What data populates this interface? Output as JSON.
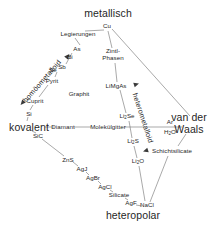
{
  "diagram": {
    "language": "de",
    "stroke_color": "#6e6e6e",
    "text_color": "#1f1f1f",
    "background": "#ffffff",
    "corners": [
      {
        "id": "metallisch",
        "label": "metallisch",
        "x": 108,
        "y": 13
      },
      {
        "id": "kovalent",
        "label": "kovalent",
        "x": 29,
        "y": 127
      },
      {
        "id": "van-der-waals",
        "label": "van der",
        "label2": "Waals",
        "x": 189,
        "y": 124
      },
      {
        "id": "heteropolar",
        "label": "heteropolar",
        "x": 133,
        "y": 215
      }
    ],
    "axis_labels": [
      {
        "id": "homoeometalloid",
        "label": "homöometalloid",
        "x": 42,
        "y": 81,
        "rotate": -49
      },
      {
        "id": "heterometalloid",
        "label": "heterometalloid",
        "x": 143,
        "y": 118,
        "rotate": 72
      }
    ],
    "compounds": [
      {
        "id": "cu",
        "label": "Cu",
        "x": 107,
        "y": 26
      },
      {
        "id": "legierungen",
        "label": "Legierungen",
        "x": 78,
        "y": 34
      },
      {
        "id": "as",
        "label": "As",
        "x": 77,
        "y": 49
      },
      {
        "id": "bi",
        "label": "Bi",
        "x": 70,
        "y": 57
      },
      {
        "id": "sb",
        "label": "Sb",
        "x": 62,
        "y": 67
      },
      {
        "id": "se",
        "label": "Se",
        "x": 53,
        "y": 70
      },
      {
        "id": "pyrit",
        "label": "Pyrit",
        "x": 52,
        "y": 81
      },
      {
        "id": "cuprit",
        "label": "Cuprit",
        "x": 35,
        "y": 101
      },
      {
        "id": "si",
        "label": "Si",
        "x": 29,
        "y": 114
      },
      {
        "id": "graphit",
        "label": "Graphit",
        "x": 79,
        "y": 94
      },
      {
        "id": "zintl-phasen",
        "label": "Zintl-",
        "label2": "Phasen",
        "x": 113,
        "y": 55
      },
      {
        "id": "limgas",
        "label": "LiMgAs",
        "x": 116,
        "y": 86
      },
      {
        "id": "li2se",
        "label": "Li₂Se",
        "x": 127,
        "y": 117
      },
      {
        "id": "li2s",
        "label": "Li₂S",
        "x": 133,
        "y": 142
      },
      {
        "id": "li2o",
        "label": "Li₂O",
        "x": 138,
        "y": 162
      },
      {
        "id": "diamant",
        "label": "Diamant",
        "x": 63,
        "y": 127
      },
      {
        "id": "molekuelgitter",
        "label": "Molekülgitter",
        "x": 108,
        "y": 127
      },
      {
        "id": "ar",
        "label": "Ar",
        "x": 170,
        "y": 122
      },
      {
        "id": "h2o",
        "label": "H₂O",
        "x": 170,
        "y": 133
      },
      {
        "id": "schichtsilicate",
        "label": "Schichtsilicate",
        "x": 172,
        "y": 151
      },
      {
        "id": "sic",
        "label": "SiC",
        "x": 38,
        "y": 136
      },
      {
        "id": "zns",
        "label": "ZnS",
        "x": 68,
        "y": 160
      },
      {
        "id": "agj",
        "label": "AgJ",
        "x": 82,
        "y": 169
      },
      {
        "id": "agbr",
        "label": "AgBr",
        "x": 93,
        "y": 178
      },
      {
        "id": "agcl",
        "label": "AgCl",
        "x": 105,
        "y": 187
      },
      {
        "id": "silicate",
        "label": "Silicate",
        "x": 119,
        "y": 195
      },
      {
        "id": "agf",
        "label": "AgF",
        "x": 131,
        "y": 203
      },
      {
        "id": "nacl",
        "label": "NaCl",
        "x": 147,
        "y": 205
      }
    ],
    "edges": [
      {
        "id": "edge-cu-legierungen",
        "x1": 104,
        "y1": 30,
        "x2": 85,
        "y2": 31
      },
      {
        "id": "edge-legierungen-as",
        "x1": 75,
        "y1": 38,
        "x2": 80,
        "y2": 45
      },
      {
        "id": "edge-as-sb",
        "x1": 72,
        "y1": 53,
        "x2": 66,
        "y2": 64
      },
      {
        "id": "edge-sb-pyrit",
        "x1": 57,
        "y1": 72,
        "x2": 55,
        "y2": 77
      },
      {
        "id": "edge-pyrit-cuprit",
        "x1": 48,
        "y1": 85,
        "x2": 39,
        "y2": 97
      },
      {
        "id": "edge-cuprit-si",
        "x1": 33,
        "y1": 105,
        "x2": 30,
        "y2": 110
      },
      {
        "id": "edge-si-kovalent",
        "x1": 28,
        "y1": 117,
        "x2": 27,
        "y2": 121
      },
      {
        "id": "edge-cu-zintl",
        "x1": 108,
        "y1": 31,
        "x2": 112,
        "y2": 48
      },
      {
        "id": "edge-zintl-limgas",
        "x1": 115,
        "y1": 63,
        "x2": 117,
        "y2": 82
      },
      {
        "id": "edge-limgas-li2se",
        "x1": 120,
        "y1": 90,
        "x2": 126,
        "y2": 113
      },
      {
        "id": "edge-li2se-li2s",
        "x1": 129,
        "y1": 121,
        "x2": 132,
        "y2": 138
      },
      {
        "id": "edge-li2s-li2o",
        "x1": 134,
        "y1": 146,
        "x2": 137,
        "y2": 158
      },
      {
        "id": "edge-li2o-nacl",
        "x1": 139,
        "y1": 166,
        "x2": 145,
        "y2": 201
      },
      {
        "id": "edge-cu-vdw",
        "x1": 112,
        "y1": 29,
        "x2": 190,
        "y2": 116
      },
      {
        "id": "edge-kovalent-diamant",
        "x1": 45,
        "y1": 127,
        "x2": 54,
        "y2": 127
      },
      {
        "id": "edge-diamant-molekuel",
        "x1": 74,
        "y1": 127,
        "x2": 91,
        "y2": 127
      },
      {
        "id": "edge-molekuel-right",
        "x1": 124,
        "y1": 127,
        "x2": 182,
        "y2": 127
      },
      {
        "id": "edge-kovalent-sic",
        "x1": 32,
        "y1": 131,
        "x2": 36,
        "y2": 133
      },
      {
        "id": "edge-sic-zns",
        "x1": 42,
        "y1": 139,
        "x2": 64,
        "y2": 156
      },
      {
        "id": "edge-zns-agj",
        "x1": 73,
        "y1": 162,
        "x2": 78,
        "y2": 166
      },
      {
        "id": "edge-agj-agbr",
        "x1": 86,
        "y1": 172,
        "x2": 89,
        "y2": 175
      },
      {
        "id": "edge-agbr-agcl",
        "x1": 98,
        "y1": 181,
        "x2": 101,
        "y2": 184
      },
      {
        "id": "edge-agcl-silicate",
        "x1": 110,
        "y1": 190,
        "x2": 113,
        "y2": 192
      },
      {
        "id": "edge-silicate-agf",
        "x1": 125,
        "y1": 198,
        "x2": 128,
        "y2": 200
      },
      {
        "id": "edge-agf-nacl",
        "x1": 136,
        "y1": 205,
        "x2": 142,
        "y2": 206
      },
      {
        "id": "edge-vdw-schicht",
        "x1": 186,
        "y1": 134,
        "x2": 178,
        "y2": 146
      },
      {
        "id": "edge-schicht-nacl",
        "x1": 168,
        "y1": 156,
        "x2": 150,
        "y2": 202
      }
    ],
    "arrows": [
      {
        "id": "arrow-homoeo-upper",
        "x": 66,
        "y": 58,
        "rotate": -49
      },
      {
        "id": "arrow-homoeo-lower",
        "x": 24,
        "y": 101,
        "rotate": 131
      },
      {
        "id": "arrow-hetero-upper",
        "x": 134,
        "y": 85,
        "rotate": -18
      },
      {
        "id": "arrow-hetero-lower",
        "x": 148,
        "y": 150,
        "rotate": 162
      }
    ]
  }
}
